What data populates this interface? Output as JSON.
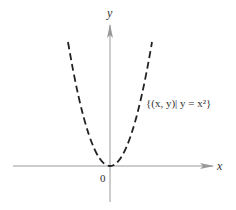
{
  "diagram": {
    "x_axis_label": "x",
    "y_axis_label": "y",
    "origin_label": "0",
    "curve_label": "{(x, y)| y = x²}",
    "curve_equation": "y = x^2",
    "curve_style": "dashed",
    "axis_color": "#999999",
    "curve_color": "#222222"
  }
}
